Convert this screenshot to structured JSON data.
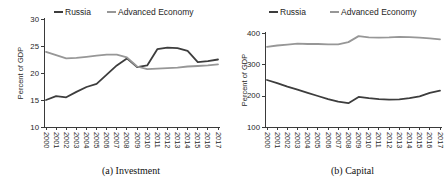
{
  "figure": {
    "background": "#ffffff",
    "axis_color": "#3a3a3a",
    "text_color": "#262626"
  },
  "chart_data": [
    {
      "type": "line",
      "title": "(a) Investment",
      "ylabel": "Percent of GDP",
      "legend_position": "top",
      "grid": false,
      "x": [
        2000,
        2001,
        2002,
        2003,
        2004,
        2005,
        2006,
        2007,
        2008,
        2009,
        2010,
        2011,
        2012,
        2013,
        2014,
        2015,
        2016,
        2017
      ],
      "ylim": [
        10,
        30
      ],
      "yticks": [
        10,
        15,
        20,
        25,
        30
      ],
      "series": [
        {
          "name": "Russia",
          "color": "#3d3d3d",
          "values": [
            15.0,
            15.7,
            15.5,
            16.5,
            17.4,
            18.0,
            19.7,
            21.4,
            22.7,
            21.1,
            21.4,
            24.4,
            24.7,
            24.6,
            24.1,
            22.0,
            22.2,
            22.5
          ]
        },
        {
          "name": "Advanced Economy",
          "color": "#979797",
          "values": [
            23.9,
            23.3,
            22.7,
            22.8,
            23.0,
            23.2,
            23.4,
            23.4,
            22.9,
            21.2,
            20.7,
            20.8,
            20.9,
            21.0,
            21.2,
            21.3,
            21.4,
            21.6
          ]
        }
      ]
    },
    {
      "type": "line",
      "title": "(b) Capital",
      "ylabel": "Percent of GDP",
      "legend_position": "top",
      "grid": false,
      "x": [
        2000,
        2001,
        2002,
        2003,
        2004,
        2005,
        2006,
        2007,
        2008,
        2009,
        2010,
        2011,
        2012,
        2013,
        2014,
        2015,
        2016,
        2017
      ],
      "ylim": [
        100,
        400
      ],
      "yticks": [
        100,
        200,
        300,
        400
      ],
      "series": [
        {
          "name": "Russia",
          "color": "#3d3d3d",
          "values": [
            250,
            240,
            229,
            219,
            209,
            199,
            189,
            181,
            176,
            196,
            192,
            189,
            187,
            188,
            192,
            198,
            209,
            216
          ]
        },
        {
          "name": "Advanced Economy",
          "color": "#979797",
          "values": [
            356,
            360,
            363,
            366,
            365,
            365,
            364,
            364,
            371,
            390,
            386,
            385,
            386,
            388,
            387,
            385,
            383,
            380
          ]
        }
      ]
    }
  ]
}
